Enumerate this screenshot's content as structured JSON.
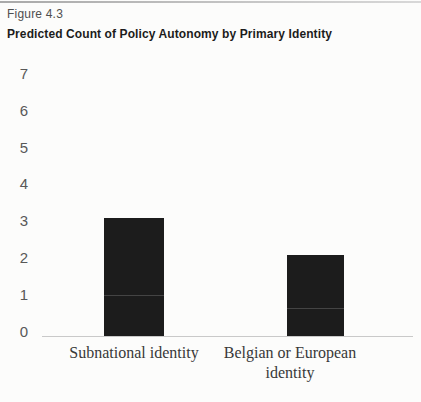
{
  "figure": {
    "label": "Figure 4.3",
    "title": "Predicted Count of Policy Autonomy by Primary Identity"
  },
  "chart_data": {
    "type": "bar",
    "title": "Predicted Count of Policy Autonomy by Primary Identity",
    "categories": [
      "Subnational identity",
      "Belgian or European identity"
    ],
    "values": [
      3.2,
      2.2
    ],
    "xlabel": "",
    "ylabel": "",
    "ylim": [
      0,
      7
    ],
    "yticks": [
      0,
      1,
      2,
      3,
      4,
      5,
      6,
      7
    ],
    "grid": false,
    "legend": false,
    "bar_color": "#1c1c1c"
  },
  "colors": {
    "background": "#fcfcfb",
    "top_rule": "#b3b3b3",
    "figure_label_text": "#4f4f4f",
    "title_text": "#1c1c1c",
    "y_tick_text": "#585858",
    "axis_line": "#c9c9c9",
    "bar": "#1c1c1c",
    "x_label_text": "#383838"
  }
}
